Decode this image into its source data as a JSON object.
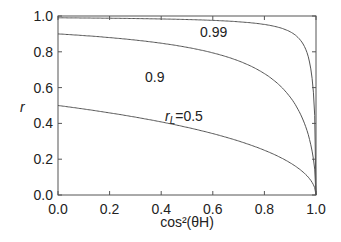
{
  "chart_data": {
    "type": "line",
    "title": "",
    "xlabel": "cos²(θH)",
    "ylabel": "r",
    "xlim": [
      0,
      1
    ],
    "ylim": [
      0,
      1
    ],
    "xticks": [
      "0.0",
      "0.2",
      "0.4",
      "0.6",
      "0.8",
      "1.0"
    ],
    "yticks": [
      "0.0",
      "0.2",
      "0.4",
      "0.6",
      "0.8",
      "1.0"
    ],
    "grid": false,
    "series": [
      {
        "name": "rL=0.5",
        "label": "rL=0.5",
        "rL": 0.5
      },
      {
        "name": "0.9",
        "label": "0.9",
        "rL": 0.9
      },
      {
        "name": "0.99",
        "label": "0.99",
        "rL": 0.99
      }
    ]
  }
}
